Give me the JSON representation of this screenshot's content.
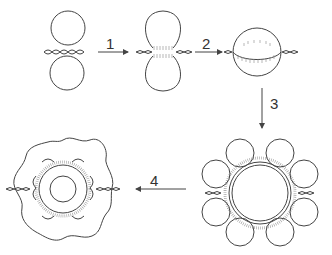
{
  "diagram": {
    "type": "process-stages",
    "stages": [
      {
        "id": "stage-a",
        "description": "two separate circles with twisted strand between"
      },
      {
        "id": "stage-b",
        "description": "circles fusing at a neck, hatched contact region"
      },
      {
        "id": "stage-c",
        "description": "single sphere with hatched equatorial band"
      },
      {
        "id": "stage-d",
        "description": "central ring with eight surrounding circles"
      },
      {
        "id": "stage-e",
        "description": "wavy outer boundary around ringed inner circle"
      }
    ],
    "steps": [
      {
        "label": "1",
        "direction": "right"
      },
      {
        "label": "2",
        "direction": "right"
      },
      {
        "label": "3",
        "direction": "down"
      },
      {
        "label": "4",
        "direction": "left"
      }
    ],
    "colors": {
      "stroke": "#444444",
      "hatch": "#888888",
      "background": "#ffffff"
    }
  }
}
